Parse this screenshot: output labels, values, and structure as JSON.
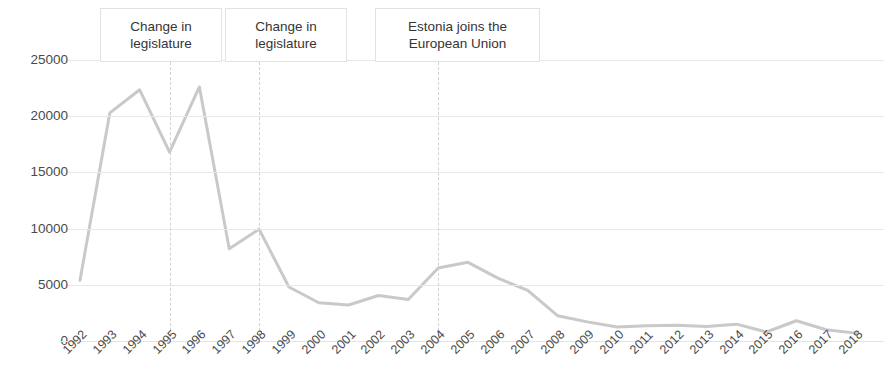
{
  "chart_data": {
    "type": "line",
    "title": "",
    "subtitle": "",
    "xlabel": "",
    "ylabel": "",
    "grid": true,
    "legend": "none",
    "xlim": [
      1992,
      2018
    ],
    "ylim": [
      0,
      25000
    ],
    "ytick_labels": [
      "25000",
      "20000",
      "15000",
      "10000",
      "5000",
      "0"
    ],
    "ytick_values": [
      25000,
      20000,
      15000,
      10000,
      5000,
      0
    ],
    "categories": [
      "1992",
      "1993",
      "1994",
      "1995",
      "1996",
      "1997",
      "1998",
      "1999",
      "2000",
      "2001",
      "2002",
      "2003",
      "2004",
      "2005",
      "2006",
      "2007",
      "2008",
      "2009",
      "2010",
      "2011",
      "2012",
      "2013",
      "2014",
      "2015",
      "2016",
      "2017",
      "2018"
    ],
    "series": [
      {
        "name": "",
        "color": "#c9c9c9",
        "values": [
          5400,
          20300,
          22350,
          16800,
          22600,
          8200,
          9950,
          4800,
          3400,
          3200,
          4050,
          3700,
          6500,
          7000,
          5600,
          4500,
          2250,
          1700,
          1250,
          1350,
          1400,
          1300,
          1500,
          800,
          1800,
          1000,
          700
        ]
      }
    ],
    "annotations": [
      {
        "id": "change-in-legislature-1",
        "text": "Change in legislature",
        "at_x": 1995,
        "box_left_px": 100,
        "box_top_px": 8,
        "box_width_px": 122,
        "box_height_px": 54
      },
      {
        "id": "change-in-legislature-2",
        "text": "Change in legislature",
        "at_x": 1998,
        "box_left_px": 225,
        "box_top_px": 8,
        "box_width_px": 122,
        "box_height_px": 54
      },
      {
        "id": "estonia-joins-eu",
        "text": "Estonia joins the European Union",
        "at_x": 2004,
        "box_left_px": 375,
        "box_top_px": 8,
        "box_width_px": 165,
        "box_height_px": 54
      }
    ],
    "vertical_markers": [
      {
        "label": "1995",
        "x": 1995
      },
      {
        "label": "1998",
        "x": 1998
      },
      {
        "label": "2004",
        "x": 2004
      }
    ],
    "colors": {
      "line": "#c9c9c9",
      "gridline": "#e9e9e9",
      "dashed_marker": "#d2d2d2",
      "text": "#3a3a3a",
      "background": "#ffffff"
    }
  }
}
